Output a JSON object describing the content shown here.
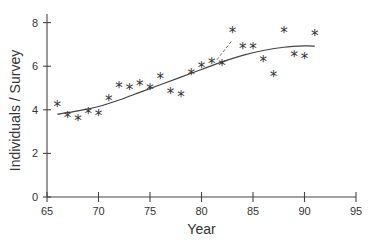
{
  "chart_data": {
    "type": "scatter",
    "title": "",
    "xlabel": "Year",
    "ylabel": "Individuals / Survey",
    "xlim": [
      65,
      95
    ],
    "ylim": [
      0,
      8.5
    ],
    "xticks": [
      65,
      70,
      75,
      80,
      85,
      90,
      95
    ],
    "yticks": [
      0,
      2,
      4,
      6,
      8
    ],
    "grid": false,
    "marker": "*",
    "points": [
      {
        "x": 66,
        "y": 4.2
      },
      {
        "x": 67,
        "y": 3.7
      },
      {
        "x": 68,
        "y": 3.6
      },
      {
        "x": 69,
        "y": 3.9
      },
      {
        "x": 70,
        "y": 3.8
      },
      {
        "x": 71,
        "y": 4.5
      },
      {
        "x": 72,
        "y": 5.1
      },
      {
        "x": 73,
        "y": 5.0
      },
      {
        "x": 74,
        "y": 5.2
      },
      {
        "x": 75,
        "y": 5.0
      },
      {
        "x": 76,
        "y": 5.5
      },
      {
        "x": 77,
        "y": 4.8
      },
      {
        "x": 78,
        "y": 4.7
      },
      {
        "x": 79,
        "y": 5.7
      },
      {
        "x": 80,
        "y": 6.0
      },
      {
        "x": 81,
        "y": 6.2
      },
      {
        "x": 82,
        "y": 6.1
      },
      {
        "x": 83,
        "y": 7.6
      },
      {
        "x": 84,
        "y": 6.9
      },
      {
        "x": 85,
        "y": 6.9
      },
      {
        "x": 86,
        "y": 6.3
      },
      {
        "x": 87,
        "y": 5.6
      },
      {
        "x": 88,
        "y": 7.6
      },
      {
        "x": 89,
        "y": 6.5
      },
      {
        "x": 90,
        "y": 6.4
      },
      {
        "x": 91,
        "y": 7.5
      }
    ],
    "fit_curve": {
      "name": "smoothed trend",
      "style": "solid",
      "x": [
        66,
        68,
        70,
        72,
        74,
        76,
        78,
        80,
        82,
        84,
        86,
        88,
        90,
        91
      ],
      "y": [
        3.8,
        3.95,
        4.15,
        4.45,
        4.8,
        5.15,
        5.5,
        5.85,
        6.2,
        6.5,
        6.72,
        6.87,
        6.93,
        6.92
      ]
    },
    "dashed_segment": {
      "style": "dashed",
      "x": [
        81.5,
        83
      ],
      "y": [
        6.3,
        7.2
      ]
    }
  }
}
